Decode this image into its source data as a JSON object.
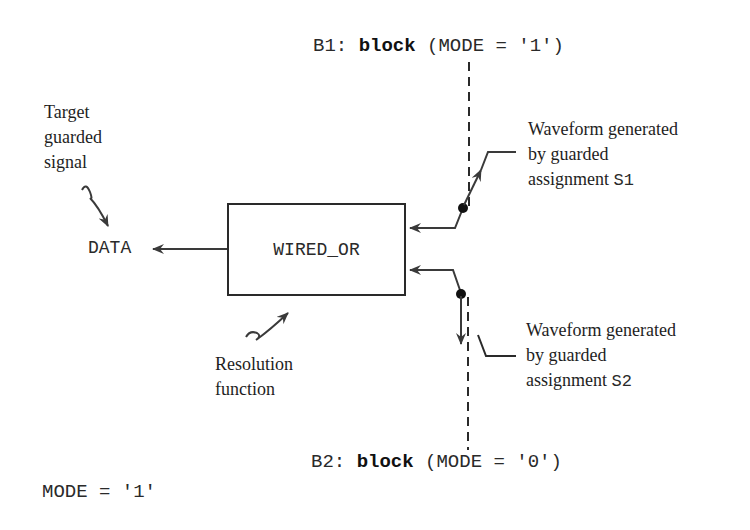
{
  "diagram": {
    "block_b1": {
      "label": "B1:",
      "keyword": "block",
      "guard": "(MODE = '1')"
    },
    "block_b2": {
      "label": "B2:",
      "keyword": "block",
      "guard": "(MODE = '0')"
    },
    "target_annotation": {
      "lines": [
        "Target",
        "guarded",
        "signal"
      ]
    },
    "target_signal": "DATA",
    "resolution_box": {
      "label": "WIRED_OR"
    },
    "resolution_annotation": {
      "lines": [
        "Resolution",
        "function"
      ]
    },
    "waveform_s1": {
      "lines": [
        "Waveform generated",
        "by guarded",
        "assignment "
      ],
      "name": "S1"
    },
    "waveform_s2": {
      "lines": [
        "Waveform generated",
        "by guarded",
        "assignment "
      ],
      "name": "S2"
    },
    "mode_value": "MODE = '1'",
    "colors": {
      "ink": "#2a2a2a",
      "background": "#ffffff"
    }
  }
}
